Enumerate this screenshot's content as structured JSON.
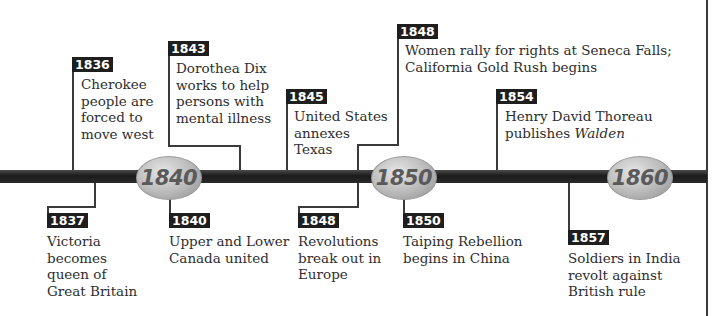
{
  "timeline": {
    "start_year": 1835,
    "end_year": 1860,
    "axis_markers": [
      {
        "label": "1840"
      },
      {
        "label": "1850"
      },
      {
        "label": "1860"
      }
    ],
    "events_above": [
      {
        "year": "1836",
        "text": "Cherokee\npeople are\nforced to\nmove west"
      },
      {
        "year": "1843",
        "text": "Dorothea Dix\nworks to help\npersons with\nmental illness"
      },
      {
        "year": "1845",
        "text": "United States\nannexes\nTexas"
      },
      {
        "year": "1848",
        "text": "Women rally for rights at Seneca Falls;\nCalifornia Gold Rush begins"
      },
      {
        "year": "1854",
        "text_plain": "Henry David Thoreau\npublishes ",
        "text_italic": "Walden"
      }
    ],
    "events_below": [
      {
        "year": "1837",
        "text": "Victoria\nbecomes\nqueen of\nGreat Britain"
      },
      {
        "year": "1840",
        "text": "Upper and Lower\nCanada united"
      },
      {
        "year": "1848",
        "text": "Revolutions\nbreak out in\nEurope"
      },
      {
        "year": "1850",
        "text": "Taiping Rebellion\nbegins in China"
      },
      {
        "year": "1857",
        "text": "Soldiers in India\nrevolt against\nBritish rule"
      }
    ]
  },
  "colors": {
    "bar": "#1e1e1e",
    "label_bg": "#1e1e1e",
    "label_text": "#ffffff",
    "oval": "#b9b9b9",
    "oval_text": "#5a5a5a"
  }
}
